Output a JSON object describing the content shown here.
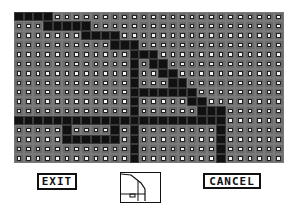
{
  "editor": {
    "grid": {
      "columns": 28,
      "rows": 16,
      "on_color": "#111111",
      "off_color": "#f4f4f4",
      "cells": [
        "1111000000000000000000000000",
        "0001111100000000000000000000",
        "0000000111100000000000000000",
        "0000000000111000000000000000",
        "0000000000001110000000000000",
        "0000000000001011000000000000",
        "0000000000001001100000000000",
        "0000000000001000110000000000",
        "0000000000001111111000000000",
        "0000000000001000001100000000",
        "0000000000001000000111000000",
        "1111111111111111111111000000",
        "0000010000101000000001000000",
        "0000011111101000000001000000",
        "0000000000001000000001000000",
        "0000000000001000000001000000"
      ]
    },
    "buttons": {
      "exit_label": "EXIT",
      "cancel_label": "CANCEL"
    },
    "preview": {
      "icon": "pattern-thumbnail"
    }
  }
}
